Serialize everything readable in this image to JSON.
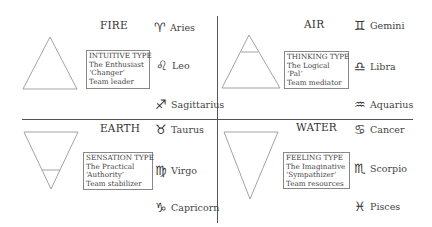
{
  "diagram": {
    "quadrants": [
      {
        "id": "fire",
        "element": "FIRE",
        "symbol": "triangle-up",
        "type_box": [
          "INTUITIVE TYPE",
          "The Enthusiast",
          "‘Changer’",
          "Team leader"
        ],
        "signs": [
          {
            "name": "Aries",
            "glyph": "♈︎",
            "icon": "aries-icon"
          },
          {
            "name": "Leo",
            "glyph": "♌︎",
            "icon": "leo-icon"
          },
          {
            "name": "Sagittarius",
            "glyph": "♐︎",
            "icon": "sagittarius-icon"
          }
        ]
      },
      {
        "id": "air",
        "element": "AIR",
        "symbol": "triangle-up-with-bar",
        "type_box": [
          "THINKING TYPE",
          "The Logical",
          "‘Pal’",
          "Team mediator"
        ],
        "signs": [
          {
            "name": "Gemini",
            "glyph": "♊︎",
            "icon": "gemini-icon"
          },
          {
            "name": "Libra",
            "glyph": "♎︎",
            "icon": "libra-icon"
          },
          {
            "name": "Aquarius",
            "glyph": "♒︎",
            "icon": "aquarius-icon"
          }
        ]
      },
      {
        "id": "earth",
        "element": "EARTH",
        "symbol": "triangle-down-with-bar",
        "type_box": [
          "SENSATION TYPE",
          "The Practical",
          "‘Authority’",
          "Team stabilizer"
        ],
        "signs": [
          {
            "name": "Taurus",
            "glyph": "♉︎",
            "icon": "taurus-icon"
          },
          {
            "name": "Virgo",
            "glyph": "♍︎",
            "icon": "virgo-icon"
          },
          {
            "name": "Capricorn",
            "glyph": "♑︎",
            "icon": "capricorn-icon"
          }
        ]
      },
      {
        "id": "water",
        "element": "WATER",
        "symbol": "triangle-down",
        "type_box": [
          "FEELING TYPE",
          "The Imaginative",
          "‘Sympathizer’",
          "Team resources"
        ],
        "signs": [
          {
            "name": "Cancer",
            "glyph": "♋︎",
            "icon": "cancer-icon"
          },
          {
            "name": "Scorpio",
            "glyph": "♏︎",
            "icon": "scorpio-icon"
          },
          {
            "name": "Pisces",
            "glyph": "♓︎",
            "icon": "pisces-icon"
          }
        ]
      }
    ],
    "colors": {
      "line": "#555555",
      "triangle": "#999999",
      "box_border": "#888888",
      "text": "#3a3a3a"
    }
  }
}
